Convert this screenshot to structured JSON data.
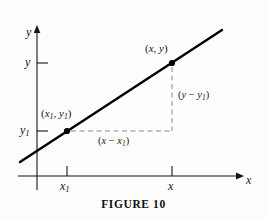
{
  "figure": {
    "caption": "FIGURE 10",
    "background_color": "#fdfdfd",
    "ink_color": "#151515",
    "line_color": "#000000",
    "dash_color": "#8a8a8a"
  },
  "axes": {
    "y_axis_label": "y",
    "x_axis_label": "x",
    "y_axis": {
      "x_px": 37,
      "top_px": 28,
      "bottom_px": 190
    },
    "x_axis": {
      "y_px": 176,
      "left_px": 18,
      "right_px": 240
    }
  },
  "ticks": {
    "y": [
      {
        "name": "y-tick-upper",
        "label_main": "y",
        "label_sub": "",
        "y_px": 63
      },
      {
        "name": "y-tick-lower",
        "label_main": "y",
        "label_sub": "1",
        "y_px": 131
      }
    ],
    "x": [
      {
        "name": "x-tick-left",
        "label_main": "x",
        "label_sub": "1",
        "x_px": 67
      },
      {
        "name": "x-tick-right",
        "label_main": "x",
        "label_sub": "",
        "x_px": 172
      }
    ]
  },
  "points": [
    {
      "name": "point-x1-y1",
      "label_open": "(",
      "label_x": "x",
      "label_x_sub": "1",
      "label_comma": ", ",
      "label_y": "y",
      "label_y_sub": "1",
      "label_close": ")",
      "x_px": 67,
      "y_px": 131
    },
    {
      "name": "point-x-y",
      "label_open": "(",
      "label_x": "x",
      "label_x_sub": "",
      "label_comma": ", ",
      "label_y": "y",
      "label_y_sub": "",
      "label_close": ")",
      "x_px": 172,
      "y_px": 63
    }
  ],
  "line": {
    "name": "slope-line",
    "start_px": {
      "x": 20,
      "y": 162
    },
    "end_px": {
      "x": 222,
      "y": 30
    },
    "stroke_width": 2.4
  },
  "deltas": {
    "rise": {
      "open": "(",
      "var1": "y",
      "op": " − ",
      "var2": "y",
      "var2_sub": "1",
      "close": ")"
    },
    "run": {
      "open": "(",
      "var1": "x",
      "op": " − ",
      "var2": "x",
      "var2_sub": "1",
      "close": ")"
    }
  },
  "dashed_guides": {
    "horizontal": {
      "from_x": 70,
      "to_x": 172,
      "y": 131
    },
    "vertical": {
      "x": 172,
      "from_y": 66,
      "to_y": 131
    }
  }
}
